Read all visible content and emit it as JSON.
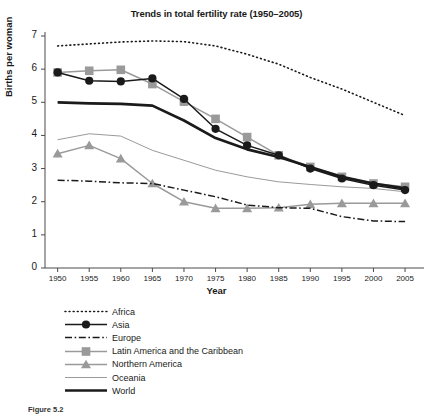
{
  "chart_data": {
    "type": "line",
    "title": "Trends in total fertility rate (1950–2005)",
    "xlabel": "Year",
    "ylabel": "Births per woman",
    "x": [
      1950,
      1955,
      1960,
      1965,
      1970,
      1975,
      1980,
      1985,
      1990,
      1995,
      2000,
      2005
    ],
    "xlim": [
      1948,
      2008
    ],
    "ylim": [
      0,
      7
    ],
    "xticks": [
      "1950",
      "1955",
      "1960",
      "1965",
      "1970",
      "1975",
      "1980",
      "1985",
      "1990",
      "1995",
      "2000",
      "2005"
    ],
    "yticks": [
      "0",
      "1",
      "2",
      "3",
      "4",
      "5",
      "6",
      "7"
    ],
    "grid": false,
    "legend_position": "below-plot",
    "series": [
      {
        "name": "Africa",
        "style": "dotted",
        "color": "#1a1a1a",
        "marker": "none",
        "values": [
          6.7,
          6.76,
          6.82,
          6.85,
          6.83,
          6.7,
          6.45,
          6.15,
          5.75,
          5.4,
          5.0,
          4.6
        ]
      },
      {
        "name": "Asia",
        "style": "solid",
        "color": "#1a1a1a",
        "marker": "circle",
        "values": [
          5.9,
          5.65,
          5.63,
          5.72,
          5.1,
          4.2,
          3.7,
          3.4,
          3.0,
          2.7,
          2.5,
          2.35
        ]
      },
      {
        "name": "Europe",
        "style": "dashdot",
        "color": "#1a1a1a",
        "marker": "none",
        "values": [
          2.65,
          2.62,
          2.57,
          2.55,
          2.35,
          2.15,
          1.9,
          1.82,
          1.8,
          1.55,
          1.42,
          1.4
        ]
      },
      {
        "name": "Latin America and the Caribbean",
        "style": "solid",
        "color": "#9a9a9a",
        "marker": "square",
        "values": [
          5.9,
          5.95,
          5.98,
          5.55,
          5.02,
          4.5,
          3.95,
          3.4,
          3.05,
          2.75,
          2.55,
          2.45
        ]
      },
      {
        "name": "Northern America",
        "style": "solid",
        "color": "#9a9a9a",
        "marker": "triangle",
        "values": [
          3.45,
          3.7,
          3.3,
          2.55,
          2.0,
          1.8,
          1.8,
          1.82,
          1.92,
          1.95,
          1.95,
          1.95
        ]
      },
      {
        "name": "Oceania",
        "style": "solid-thin",
        "color": "#9a9a9a",
        "marker": "none",
        "values": [
          3.87,
          4.05,
          3.98,
          3.55,
          3.25,
          2.95,
          2.75,
          2.6,
          2.52,
          2.45,
          2.4,
          2.3
        ]
      },
      {
        "name": "World",
        "style": "solid-thick",
        "color": "#1a1a1a",
        "marker": "none",
        "values": [
          5.0,
          4.97,
          4.95,
          4.9,
          4.45,
          3.92,
          3.58,
          3.35,
          3.05,
          2.75,
          2.55,
          2.4
        ]
      }
    ]
  },
  "caption": {
    "figure_number": "Figure 5.2",
    "text": ""
  }
}
